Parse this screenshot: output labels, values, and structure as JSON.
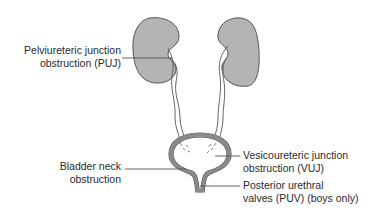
{
  "diagram": {
    "type": "anatomical-urinary-tract",
    "colors": {
      "kidney_fill": "#b4b4b4",
      "outline": "#555555",
      "leader_line": "#555555",
      "text": "#2a2a2a",
      "background": "#ffffff"
    },
    "labels": {
      "puj": {
        "line1": "Pelviureteric junction",
        "line2": "obstruction (PUJ)"
      },
      "bladder_neck": {
        "line1": "Bladder neck",
        "line2": "obstruction"
      },
      "vuj": {
        "line1": "Vesicoureteric junction",
        "line2": "obstruction (VUJ)"
      },
      "puv": {
        "line1": "Posterior urethral",
        "line2": "valves (PUV) (boys only)"
      }
    }
  }
}
